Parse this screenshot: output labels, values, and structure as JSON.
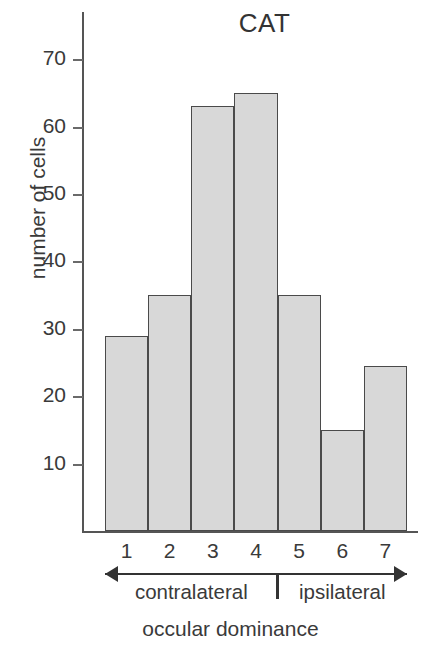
{
  "chart_data": {
    "type": "bar",
    "title": "CAT",
    "xlabel": "occular dominance",
    "ylabel": "number of cells",
    "categories": [
      "1",
      "2",
      "3",
      "4",
      "5",
      "6",
      "7"
    ],
    "values": [
      29,
      35,
      63,
      65,
      35,
      15,
      24.5
    ],
    "ylim": [
      0,
      77
    ],
    "yticks": [
      10,
      20,
      30,
      40,
      50,
      60,
      70
    ],
    "ytick_labels": [
      "10",
      "20",
      "30",
      "40",
      "50",
      "60",
      "70"
    ],
    "grid": false,
    "legend": "none",
    "bar_fill_color": "#d8d8d8",
    "bar_edge_color": "#4a4a4a",
    "axis_color": "#555555",
    "annotations": [
      {
        "label": "contralateral",
        "arrow": "left",
        "spans_categories": [
          "1",
          "2",
          "3",
          "4"
        ]
      },
      {
        "label": "ipsilateral",
        "arrow": "right",
        "spans_categories": [
          "5",
          "6",
          "7"
        ]
      }
    ]
  }
}
